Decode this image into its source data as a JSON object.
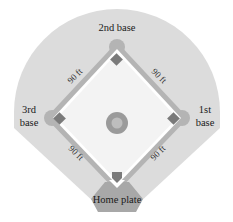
{
  "diagram": {
    "type": "baseball-diamond",
    "labels": {
      "second_base": "2nd base",
      "third_base_line1": "3rd",
      "third_base_line2": "base",
      "first_base_line1": "1st",
      "first_base_line2": "base",
      "home_plate": "Home plate"
    },
    "distances": {
      "home_to_third": "90 ft",
      "third_to_second": "90 ft",
      "second_to_first": "90 ft",
      "first_to_home": "90 ft"
    },
    "colors": {
      "outfield": "#dcdcdc",
      "base_path": "#b4b4b4",
      "infield": "#f4f4f4",
      "base": "#7a7a7a",
      "mound_ring": "#9a9a9a",
      "mound_center": "#bdbdbd",
      "home_area": "#a8a8a8"
    }
  }
}
